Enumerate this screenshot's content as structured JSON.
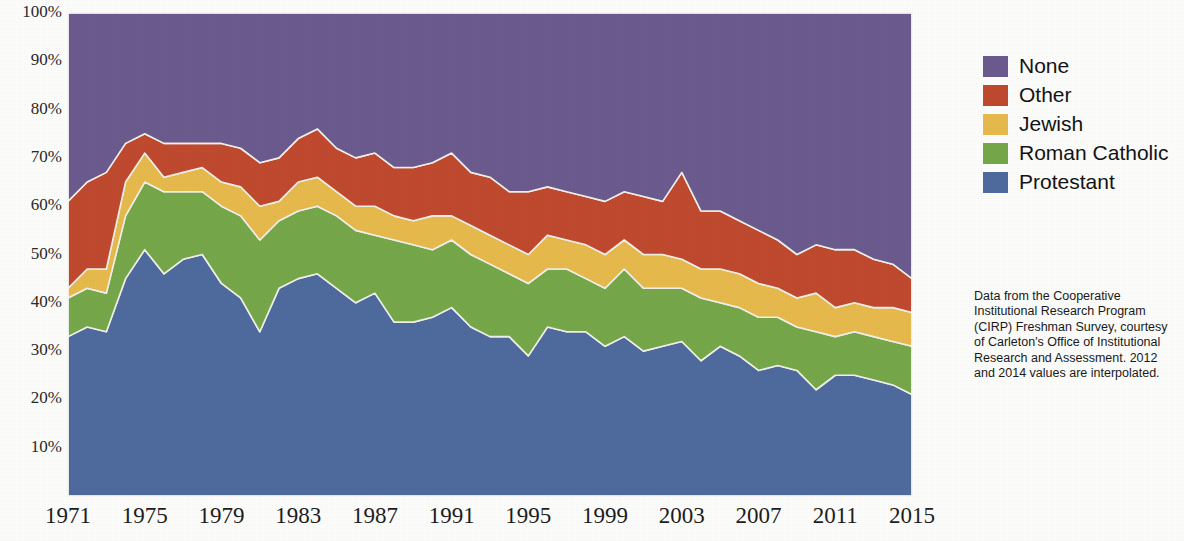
{
  "chart_data": {
    "type": "area",
    "stacked": true,
    "title": "",
    "xlabel": "",
    "ylabel": "",
    "ylim": [
      0,
      100
    ],
    "xlim": [
      1971,
      2015
    ],
    "grid": false,
    "legend_position": "right",
    "y_ticks": [
      "100%",
      "90%",
      "80%",
      "70%",
      "60%",
      "50%",
      "40%",
      "30%",
      "20%",
      "10%"
    ],
    "y_tick_values": [
      100,
      90,
      80,
      70,
      60,
      50,
      40,
      30,
      20,
      10
    ],
    "x_ticks": [
      "1971",
      "1975",
      "1979",
      "1983",
      "1987",
      "1991",
      "1995",
      "1999",
      "2003",
      "2007",
      "2011",
      "2015"
    ],
    "x_tick_values": [
      1971,
      1975,
      1979,
      1983,
      1987,
      1991,
      1995,
      1999,
      2003,
      2007,
      2011,
      2015
    ],
    "x": [
      1971,
      1972,
      1973,
      1974,
      1975,
      1976,
      1977,
      1978,
      1979,
      1980,
      1981,
      1982,
      1983,
      1984,
      1985,
      1986,
      1987,
      1988,
      1989,
      1990,
      1991,
      1992,
      1993,
      1994,
      1995,
      1996,
      1997,
      1998,
      1999,
      2000,
      2001,
      2002,
      2003,
      2004,
      2005,
      2006,
      2007,
      2008,
      2009,
      2010,
      2011,
      2012,
      2013,
      2014,
      2015
    ],
    "series": [
      {
        "name": "Protestant",
        "color": "#4f6b9e",
        "values": [
          33,
          35,
          34,
          45,
          51,
          46,
          49,
          50,
          44,
          41,
          34,
          43,
          45,
          46,
          43,
          40,
          42,
          36,
          36,
          37,
          39,
          35,
          33,
          33,
          29,
          35,
          34,
          34,
          31,
          33,
          30,
          31,
          32,
          28,
          31,
          29,
          26,
          27,
          26,
          22,
          25,
          25,
          24,
          23,
          21
        ]
      },
      {
        "name": "Roman Catholic",
        "color": "#76a84a",
        "values": [
          8,
          8,
          8,
          13,
          14,
          17,
          14,
          13,
          16,
          17,
          19,
          14,
          14,
          14,
          15,
          15,
          12,
          17,
          16,
          14,
          14,
          15,
          15,
          13,
          15,
          12,
          13,
          11,
          12,
          14,
          13,
          12,
          11,
          13,
          9,
          10,
          11,
          10,
          9,
          12,
          8,
          9,
          9,
          9,
          10
        ]
      },
      {
        "name": "Jewish",
        "color": "#e8ba4d",
        "values": [
          2,
          4,
          5,
          7,
          6,
          3,
          4,
          5,
          5,
          6,
          7,
          4,
          6,
          6,
          5,
          5,
          6,
          5,
          5,
          7,
          5,
          6,
          6,
          6,
          6,
          7,
          6,
          7,
          7,
          6,
          7,
          7,
          6,
          6,
          7,
          7,
          7,
          6,
          6,
          8,
          6,
          6,
          6,
          7,
          7
        ]
      },
      {
        "name": "Other",
        "color": "#c04a2f",
        "values": [
          18,
          18,
          20,
          8,
          4,
          7,
          6,
          5,
          8,
          8,
          9,
          9,
          9,
          10,
          9,
          10,
          11,
          10,
          11,
          11,
          13,
          11,
          12,
          11,
          13,
          10,
          10,
          10,
          11,
          10,
          12,
          11,
          18,
          12,
          12,
          11,
          11,
          10,
          9,
          10,
          12,
          11,
          10,
          9,
          7
        ]
      },
      {
        "name": "None",
        "color": "#6b5b8e",
        "values": [
          39,
          35,
          33,
          27,
          25,
          27,
          27,
          27,
          27,
          28,
          31,
          30,
          26,
          24,
          28,
          30,
          29,
          32,
          32,
          31,
          29,
          33,
          34,
          37,
          37,
          36,
          37,
          38,
          39,
          37,
          38,
          39,
          33,
          41,
          41,
          43,
          45,
          47,
          50,
          48,
          49,
          49,
          51,
          52,
          55
        ]
      }
    ],
    "legend": [
      {
        "label": "None",
        "color": "#6b5b8e"
      },
      {
        "label": "Other",
        "color": "#c04a2f"
      },
      {
        "label": "Jewish",
        "color": "#e8ba4d"
      },
      {
        "label": "Roman Catholic",
        "color": "#76a84a"
      },
      {
        "label": "Protestant",
        "color": "#4f6b9e"
      }
    ],
    "caption": "Data from the Cooperative Institutional Research Program (CIRP) Freshman Survey, courtesy of Carleton's Office of Institutional Research and Assessment. 2012 and 2014 values are interpolated."
  }
}
